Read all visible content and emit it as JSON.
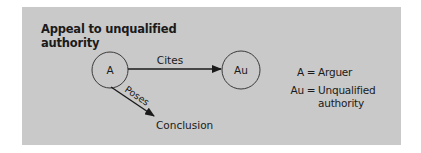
{
  "diagram": {
    "title": "Appeal to unqualified authority",
    "title_line1": "Appeal to unqualified",
    "title_line2": "authority",
    "background_color": "#c9c9c9",
    "nodes": [
      {
        "id": "A",
        "label": "A",
        "shape": "circle"
      },
      {
        "id": "Au",
        "label": "Au",
        "shape": "circle"
      },
      {
        "id": "Conclusion",
        "label": "Conclusion",
        "shape": "text"
      }
    ],
    "edges": [
      {
        "from": "A",
        "to": "Au",
        "label": "Cites"
      },
      {
        "from": "A",
        "to": "Conclusion",
        "label": "Poses"
      }
    ],
    "legend": [
      {
        "key": "A",
        "value": "Arguer"
      },
      {
        "key": "Au",
        "value_line1": "Unqualified",
        "value_line2": "authority",
        "value": "Unqualified authority"
      }
    ]
  }
}
